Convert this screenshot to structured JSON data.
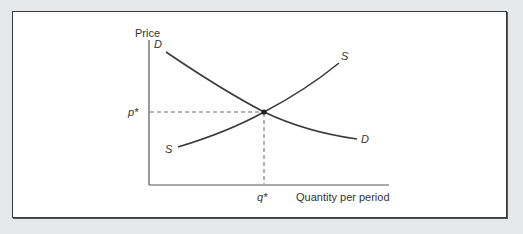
{
  "diagram": {
    "type": "supply-demand",
    "y_axis_label": "Price",
    "x_axis_label": "Quantity per period",
    "equilibrium_price_label": "p*",
    "equilibrium_quantity_label": "q*",
    "curves": {
      "demand": {
        "label_top": "D",
        "label_bottom": "D",
        "color": "#3a3a3a"
      },
      "supply": {
        "label_top": "S",
        "label_bottom": "S",
        "color": "#3a3a3a"
      }
    },
    "colors": {
      "background": "#e6e7e9",
      "panel": "#ffffff",
      "line": "#3a3a3a",
      "text": "#333333"
    }
  }
}
